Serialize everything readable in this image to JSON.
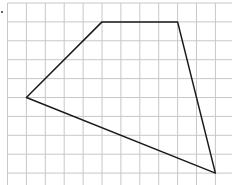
{
  "diagram": {
    "type": "quadrilateral-on-grid",
    "grid": {
      "origin_x": 7.5,
      "origin_y": 3,
      "cell": 18.9,
      "cols": 12,
      "rows": 10,
      "line_color": "#c8c8c8"
    },
    "shape": {
      "stroke_color": "#1a1a1a",
      "vertices_grid": [
        [
          1,
          5
        ],
        [
          5,
          1
        ],
        [
          9,
          1
        ],
        [
          11,
          9
        ]
      ]
    },
    "marker": {
      "x": 2,
      "y": 12,
      "color": "#333333"
    }
  }
}
